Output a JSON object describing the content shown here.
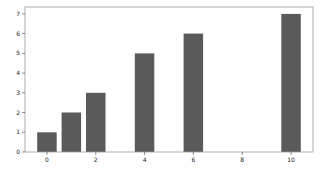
{
  "chart_data": {
    "type": "bar",
    "title": "",
    "xlabel": "",
    "ylabel": "",
    "x": [
      0,
      1,
      2,
      4,
      6,
      10
    ],
    "values": [
      1,
      2,
      3,
      5,
      6,
      7
    ],
    "bar_width": 0.8,
    "bar_color": "#5a5a5a",
    "xticks": [
      0,
      2,
      4,
      6,
      8,
      10
    ],
    "yticks": [
      0,
      1,
      2,
      3,
      4,
      5,
      6,
      7
    ],
    "xlim": [
      -0.9,
      10.9
    ],
    "ylim": [
      0,
      7.35
    ],
    "grid": false,
    "legend": null
  },
  "layout": {
    "plot_left": 25,
    "plot_top": 7,
    "plot_right": 313,
    "plot_bottom": 152,
    "frame_color": "#999999",
    "tick_color": "#444444"
  }
}
